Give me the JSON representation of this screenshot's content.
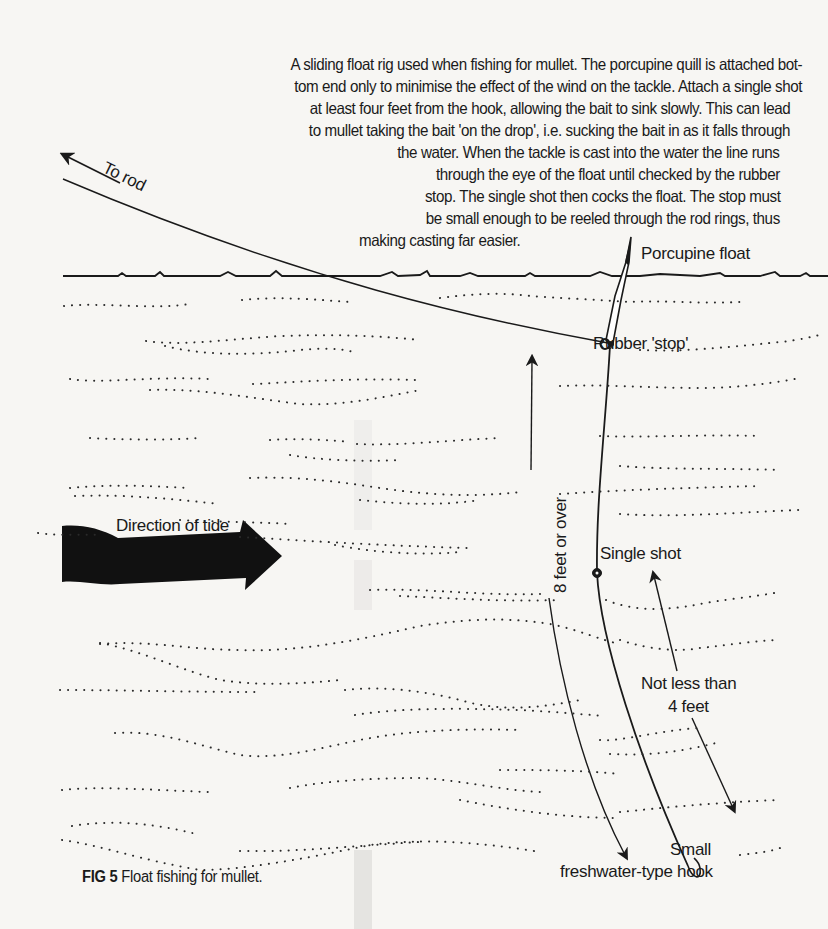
{
  "description": {
    "lines": [
      "A sliding float rig used when fishing for mullet. The porcupine quill is attached bot-",
      "tom end only to minimise  the effect of the wind on the tackle. Attach a single shot",
      "at least four feet from the hook, allowing the bait to sink  slowly. This can lead",
      "to mullet taking the bait 'on the drop',  i.e. sucking the bait in as it falls through",
      "the water.  When the tackle is cast into the water the line runs",
      "through the eye of the float until checked by the rubber",
      "stop. The single shot then cocks the float. The stop must",
      "be small enough to be reeled through the rod rings, thus",
      "making casting far easier."
    ]
  },
  "labels": {
    "to_rod": "To rod",
    "porcupine_float": "Porcupine float",
    "rubber_stop": "Rubber 'stop'",
    "direction_of_tide": "Direction of tide",
    "eight_feet": "8 feet or over",
    "single_shot": "Single shot",
    "not_less_than": "Not less than",
    "four_feet": "4 feet",
    "small": "Small",
    "hook_type": "freshwater-type hook"
  },
  "caption": {
    "fig_number": "FIG 5",
    "text": "Float fishing for mullet."
  },
  "colors": {
    "background": "#f7f6f3",
    "ink": "#1a1a1a"
  }
}
